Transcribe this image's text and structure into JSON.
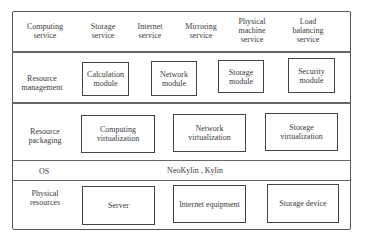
{
  "services": [
    {
      "label": "Computing\nservice",
      "x": 45,
      "y": 22
    },
    {
      "label": "Storage\nservice",
      "x": 103,
      "y": 22
    },
    {
      "label": "Internet\nservice",
      "x": 150,
      "y": 22
    },
    {
      "label": "Mirroring\nservice",
      "x": 201,
      "y": 22
    },
    {
      "label": "Physical\nmachine\nservice",
      "x": 252,
      "y": 17
    },
    {
      "label": "Load\nbalancing\nservice",
      "x": 308,
      "y": 17
    }
  ],
  "layers": [
    {
      "label": "Resource\nmanagement",
      "x": 42,
      "y": 74
    },
    {
      "label": "Resource\npackaging",
      "x": 45,
      "y": 127
    },
    {
      "label": "OS",
      "x": 44,
      "y": 167
    },
    {
      "label": "Physical\nresources",
      "x": 45,
      "y": 189
    }
  ],
  "os_value": "NeoKylin , Kylin",
  "management_modules": [
    {
      "label": "Calculation\nmodule",
      "x": 82,
      "y": 62,
      "w": 47,
      "h": 34
    },
    {
      "label": "Network\nmodule",
      "x": 151,
      "y": 61,
      "w": 46,
      "h": 35
    },
    {
      "label": "Storage\nmodule",
      "x": 218,
      "y": 60,
      "w": 46,
      "h": 33
    },
    {
      "label": "Security\nmodule",
      "x": 288,
      "y": 58,
      "w": 47,
      "h": 35
    }
  ],
  "packaging_modules": [
    {
      "label": "Computing\nvirtualization",
      "x": 81,
      "y": 115,
      "w": 74,
      "h": 38
    },
    {
      "label": "Network\nvirtualization",
      "x": 173,
      "y": 114,
      "w": 73,
      "h": 38
    },
    {
      "label": "Storage\nvirtualization",
      "x": 265,
      "y": 113,
      "w": 73,
      "h": 38
    }
  ],
  "physical_modules": [
    {
      "label": "Server",
      "x": 82,
      "y": 186,
      "w": 73,
      "h": 39
    },
    {
      "label": "Internet equipment",
      "x": 173,
      "y": 185,
      "w": 73,
      "h": 38
    },
    {
      "label": "Storage device",
      "x": 267,
      "y": 184,
      "w": 72,
      "h": 39
    }
  ]
}
